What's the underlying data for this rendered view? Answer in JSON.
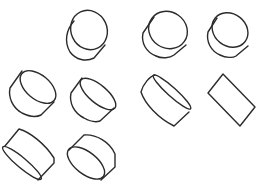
{
  "figure": {
    "background": "#ffffff",
    "stroke_color": "#2b2b2b",
    "shapes": [
      {
        "id": "cylinder-1",
        "row": 1,
        "col": 2,
        "view": "end-face upper-right, large ellipse"
      },
      {
        "id": "cylinder-2",
        "row": 1,
        "col": 3,
        "view": "end-face upper-right, slightly tilted"
      },
      {
        "id": "cylinder-3",
        "row": 1,
        "col": 4,
        "view": "end-face upper-right, slightly tilted"
      },
      {
        "id": "cylinder-4",
        "row": 2,
        "col": 1,
        "view": "end-face upper-right, narrower ellipse"
      },
      {
        "id": "cylinder-5",
        "row": 2,
        "col": 2,
        "view": "end-face upper-right, narrow ellipse"
      },
      {
        "id": "cylinder-6",
        "row": 2,
        "col": 3,
        "view": "end-face nearly edge-on"
      },
      {
        "id": "cylinder-7",
        "row": 2,
        "col": 4,
        "view": "side-on, appears as rectangle"
      },
      {
        "id": "cylinder-8",
        "row": 3,
        "col": 1,
        "view": "end-face lower-left, narrow ellipse"
      },
      {
        "id": "cylinder-9",
        "row": 3,
        "col": 2,
        "view": "end-face lower-left, wider ellipse"
      }
    ]
  }
}
